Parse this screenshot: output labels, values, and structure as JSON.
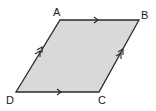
{
  "diagram": {
    "fill_color": "#d9d9d9",
    "stroke_color": "#2a2a2a",
    "vertices": [
      {
        "label": "A",
        "x": 60,
        "y": 20,
        "lx": 57,
        "ly": 17
      },
      {
        "label": "B",
        "x": 139,
        "y": 20,
        "lx": 142,
        "ly": 17
      },
      {
        "label": "C",
        "x": 99,
        "y": 92,
        "lx": 100,
        "ly": 104
      },
      {
        "label": "D",
        "x": 16,
        "y": 92,
        "lx": 7,
        "ly": 104
      }
    ],
    "markings": [
      {
        "side": "AB",
        "type": "single-arrow"
      },
      {
        "side": "DC",
        "type": "single-arrow"
      },
      {
        "side": "DA",
        "type": "double-arrow"
      },
      {
        "side": "CB",
        "type": "double-arrow"
      }
    ]
  }
}
